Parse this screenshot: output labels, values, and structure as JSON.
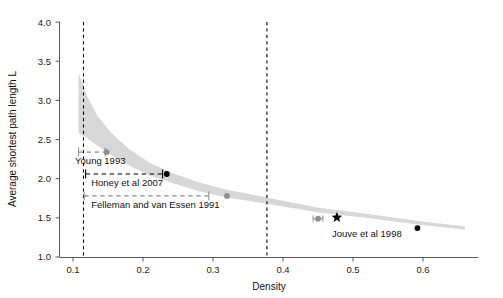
{
  "chart_data": {
    "type": "scatter",
    "title": "",
    "xlabel": "Density",
    "ylabel": "Average shortest path length L",
    "xlim": [
      0.07,
      0.665
    ],
    "ylim": [
      1.0,
      4.0
    ],
    "xticks": [
      0.1,
      0.2,
      0.3,
      0.4,
      0.5,
      0.6
    ],
    "xtick_labels": [
      "0.1",
      "0.2",
      "0.3",
      "0.4",
      "0.5",
      "0.6"
    ],
    "yticks": [
      1.0,
      1.5,
      2.0,
      2.5,
      3.0,
      3.5,
      4.0
    ],
    "ytick_labels": [
      "1.0",
      "1.5",
      "2.0",
      "2.5",
      "3.0",
      "3.5",
      "4.0"
    ],
    "grid": false,
    "legend": "none",
    "reference_lines": [
      {
        "name": "lower-density-bound",
        "x": 0.115,
        "style": "dashed",
        "color": "#000000"
      },
      {
        "name": "upper-density-bound",
        "x": 0.377,
        "style": "dashed",
        "color": "#000000"
      }
    ],
    "band": {
      "name": "model-uncertainty-band",
      "color": "#bfbfbf",
      "x": [
        0.108,
        0.12,
        0.135,
        0.155,
        0.18,
        0.21,
        0.24,
        0.28,
        0.32,
        0.377,
        0.45,
        0.52,
        0.6,
        0.66
      ],
      "upper": [
        3.35,
        3.06,
        2.8,
        2.58,
        2.38,
        2.2,
        2.08,
        1.95,
        1.86,
        1.76,
        1.63,
        1.55,
        1.45,
        1.39
      ],
      "lower": [
        2.58,
        2.52,
        2.42,
        2.3,
        2.17,
        2.04,
        1.95,
        1.84,
        1.76,
        1.68,
        1.57,
        1.5,
        1.41,
        1.35
      ]
    },
    "series": [
      {
        "name": "Young 1993",
        "label": "Young 1993",
        "marker": "circle",
        "color": "#8e8e8e",
        "x": 0.148,
        "y": 2.34,
        "xerr_low": 0.108,
        "xerr_high": 0.146,
        "errorbar_style": "dashed",
        "label_x": 0.103,
        "label_y": 2.19,
        "label_anchor": "start"
      },
      {
        "name": "Honey et al 2007",
        "label": "Honey et al 2007",
        "marker": "circle",
        "color": "#000000",
        "x": 0.234,
        "y": 2.06,
        "xerr_low": 0.118,
        "xerr_high": 0.228,
        "errorbar_style": "dashed",
        "label_x": 0.126,
        "label_y": 1.91,
        "label_anchor": "start"
      },
      {
        "name": "Felleman and van Essen 1991",
        "label": "Felleman and van Essen 1991",
        "marker": "circle",
        "color": "#8e8e8e",
        "x": 0.32,
        "y": 1.78,
        "xerr_low": 0.116,
        "xerr_high": 0.294,
        "errorbar_style": "dashed",
        "label_x": 0.126,
        "label_y": 1.63,
        "label_anchor": "start"
      },
      {
        "name": "unlabelled-gray-point",
        "label": "",
        "marker": "circle",
        "color": "#8e8e8e",
        "x": 0.45,
        "y": 1.49,
        "xerr_low": 0.443,
        "xerr_high": 0.457,
        "errorbar_style": "solid",
        "label_x": null,
        "label_y": null,
        "label_anchor": "start"
      },
      {
        "name": "star-point",
        "label": "",
        "marker": "star",
        "color": "#000000",
        "x": 0.477,
        "y": 1.505,
        "xerr_low": null,
        "xerr_high": null,
        "errorbar_style": "none",
        "label_x": null,
        "label_y": null,
        "label_anchor": "start"
      },
      {
        "name": "Jouve et al 1998",
        "label": "Jouve et al 1998",
        "marker": "circle",
        "color": "#000000",
        "x": 0.592,
        "y": 1.37,
        "xerr_low": null,
        "xerr_high": null,
        "errorbar_style": "none",
        "label_x": 0.47,
        "label_y": 1.26,
        "label_anchor": "start"
      }
    ]
  }
}
